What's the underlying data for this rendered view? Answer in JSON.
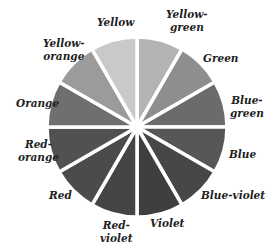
{
  "diagram": {
    "title": "",
    "center": [
      137,
      127
    ],
    "radius": 90,
    "divider_color": "#ffffff",
    "segments": [
      {
        "name": "Yellow-green",
        "label": "Yellow-\ngreen",
        "start_deg": 0,
        "end_deg": 30,
        "shade": "#b3b3b3",
        "label_pos": [
          166,
          8
        ]
      },
      {
        "name": "Green",
        "label": "Green",
        "start_deg": 30,
        "end_deg": 60,
        "shade": "#8e8e8e",
        "label_pos": [
          203,
          52
        ]
      },
      {
        "name": "Blue-green",
        "label": "Blue-\ngreen",
        "start_deg": 60,
        "end_deg": 90,
        "shade": "#6b6b6b",
        "label_pos": [
          230,
          94
        ]
      },
      {
        "name": "Blue",
        "label": "Blue",
        "start_deg": 90,
        "end_deg": 120,
        "shade": "#575757",
        "label_pos": [
          229,
          148
        ]
      },
      {
        "name": "Blue-violet",
        "label": "Blue-violet",
        "start_deg": 120,
        "end_deg": 150,
        "shade": "#474747",
        "label_pos": [
          201,
          189
        ]
      },
      {
        "name": "Violet",
        "label": "Violet",
        "start_deg": 150,
        "end_deg": 180,
        "shade": "#3f3f3f",
        "label_pos": [
          150,
          217
        ]
      },
      {
        "name": "Red-violet",
        "label": "Red-\nviolet",
        "start_deg": 180,
        "end_deg": 210,
        "shade": "#454545",
        "label_pos": [
          100,
          219
        ]
      },
      {
        "name": "Red",
        "label": "Red",
        "start_deg": 210,
        "end_deg": 240,
        "shade": "#4b4b4b",
        "label_pos": [
          49,
          189
        ]
      },
      {
        "name": "Red-orange",
        "label": "Red-\norange",
        "start_deg": 240,
        "end_deg": 270,
        "shade": "#515151",
        "label_pos": [
          18,
          138
        ]
      },
      {
        "name": "Orange",
        "label": "Orange",
        "start_deg": 270,
        "end_deg": 300,
        "shade": "#6f6f6f",
        "label_pos": [
          16,
          97
        ]
      },
      {
        "name": "Yellow-orange",
        "label": "Yellow-\norange",
        "start_deg": 300,
        "end_deg": 330,
        "shade": "#9b9b9b",
        "label_pos": [
          43,
          37
        ]
      },
      {
        "name": "Yellow",
        "label": "Yellow",
        "start_deg": 330,
        "end_deg": 360,
        "shade": "#c9c9c9",
        "label_pos": [
          97,
          16
        ]
      }
    ]
  }
}
